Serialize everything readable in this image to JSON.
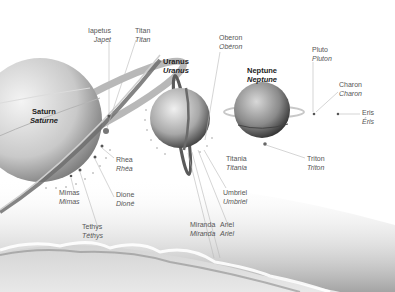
{
  "diagram": {
    "planets": [
      {
        "name": "Saturn",
        "name_fr": "Saturne"
      },
      {
        "name": "Uranus",
        "name_fr": "Uranus"
      },
      {
        "name": "Neptune",
        "name_fr": "Neptune"
      }
    ],
    "moons": {
      "saturn": [
        {
          "name": "Iapetus",
          "name_fr": "Japet"
        },
        {
          "name": "Titan",
          "name_fr": "Titan"
        },
        {
          "name": "Rhea",
          "name_fr": "Rhéa"
        },
        {
          "name": "Dione",
          "name_fr": "Dioné"
        },
        {
          "name": "Mimas",
          "name_fr": "Mimas"
        },
        {
          "name": "Tethys",
          "name_fr": "Téthys"
        }
      ],
      "uranus": [
        {
          "name": "Oberon",
          "name_fr": "Obéron"
        },
        {
          "name": "Titania",
          "name_fr": "Titania"
        },
        {
          "name": "Umbriel",
          "name_fr": "Umbriel"
        },
        {
          "name": "Miranda",
          "name_fr": "Miranda"
        },
        {
          "name": "Ariel",
          "name_fr": "Ariel"
        }
      ],
      "neptune": [
        {
          "name": "Triton",
          "name_fr": "Triton"
        }
      ]
    },
    "dwarf_planets": [
      {
        "name": "Pluto",
        "name_fr": "Pluton"
      },
      {
        "name": "Charon",
        "name_fr": "Charon"
      },
      {
        "name": "Eris",
        "name_fr": "Éris"
      }
    ]
  }
}
